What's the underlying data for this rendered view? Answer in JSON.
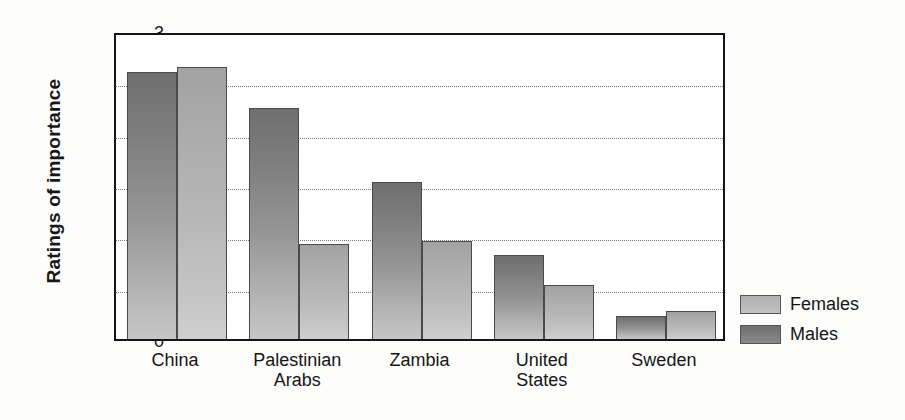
{
  "chart_data": {
    "type": "bar",
    "title": "",
    "xlabel": "",
    "ylabel": "Ratings of importance",
    "ylim": [
      0,
      3
    ],
    "ytick_labels": [
      "3",
      "2.5",
      "2",
      "1.5",
      "1",
      "0.5",
      "0"
    ],
    "ytick_values": [
      3,
      2.5,
      2,
      1.5,
      1,
      0.5,
      0
    ],
    "grid": "horizontal-dotted",
    "legend_position": "bottom-right-outside",
    "categories": [
      "China",
      "Palestinian Arabs",
      "Zambia",
      "United States",
      "Sweden"
    ],
    "category_label_lines": [
      [
        "China"
      ],
      [
        "Palestinian",
        "Arabs"
      ],
      [
        "Zambia"
      ],
      [
        "United",
        "States"
      ],
      [
        "Sweden"
      ]
    ],
    "series": [
      {
        "name": "Males",
        "color": "#7d7d7d",
        "values": [
          2.6,
          2.25,
          1.53,
          0.82,
          0.22
        ]
      },
      {
        "name": "Females",
        "color": "#bcbcbc",
        "values": [
          2.65,
          0.93,
          0.95,
          0.53,
          0.27
        ]
      }
    ],
    "series_draw_order": [
      "Males",
      "Females"
    ]
  },
  "legend": {
    "entries": [
      {
        "label": "Females",
        "swatch": "females-swatch"
      },
      {
        "label": "Males",
        "swatch": "males-swatch"
      }
    ]
  }
}
